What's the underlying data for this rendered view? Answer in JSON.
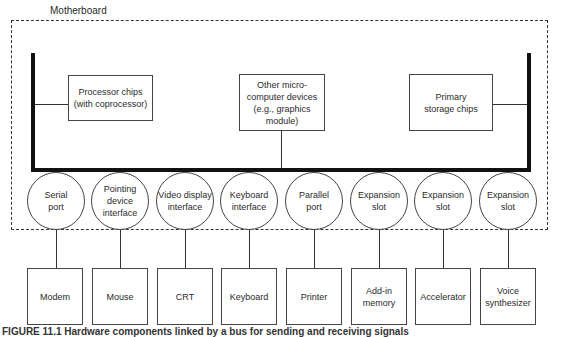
{
  "diagram": {
    "title": "Motherboard",
    "chips": [
      {
        "label": "Processor chips\n(with coprocessor)"
      },
      {
        "label": "Other micro-\ncomputer devices\n(e.g., graphics module)"
      },
      {
        "label": "Primary\nstorage chips"
      }
    ],
    "ports": [
      {
        "label": "Serial\nport"
      },
      {
        "label": "Pointing\ndevice\ninterface"
      },
      {
        "label": "Video display\ninterface"
      },
      {
        "label": "Keyboard\ninterface"
      },
      {
        "label": "Parallel\nport"
      },
      {
        "label": "Expansion\nslot"
      },
      {
        "label": "Expansion\nslot"
      },
      {
        "label": "Expansion\nslot"
      }
    ],
    "devices": [
      {
        "label": "Modem"
      },
      {
        "label": "Mouse"
      },
      {
        "label": "CRT"
      },
      {
        "label": "Keyboard"
      },
      {
        "label": "Printer"
      },
      {
        "label": "Add-in\nmemory"
      },
      {
        "label": "Accelerator"
      },
      {
        "label": "Voice\nsynthesizer"
      }
    ],
    "caption": "FIGURE 11.1  Hardware components linked by a bus for sending and receiving signals"
  }
}
